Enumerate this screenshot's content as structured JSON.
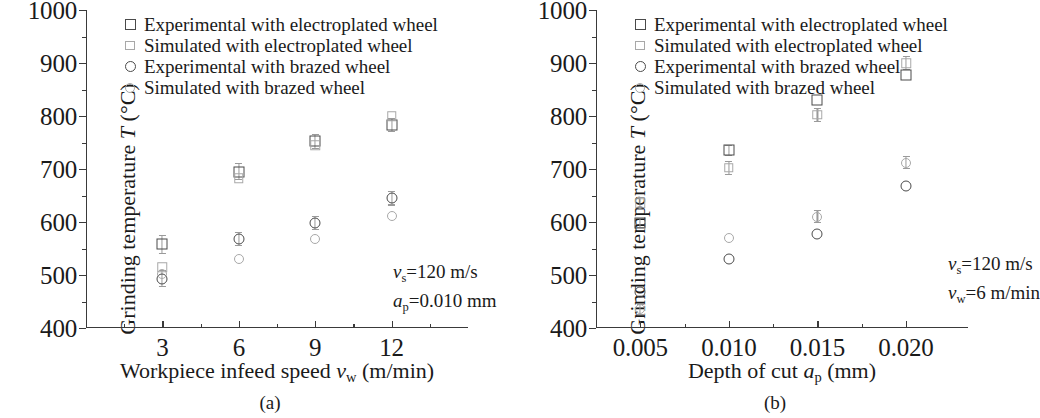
{
  "figure": {
    "panels": [
      {
        "caption": "(a)",
        "ytitle_prefix": "Grinding temperature ",
        "ytitle_var": "T",
        "ytitle_suffix": " (°C)",
        "xtitle_prefix": "Workpiece infeed speed ",
        "xtitle_var": "v",
        "xtitle_sub": "w",
        "xtitle_suffix": " (m/min)",
        "annotation": [
          {
            "var": "v",
            "sub": "s",
            "rest": "=120 m/s"
          },
          {
            "var": "a",
            "sub": "p",
            "rest": "=0.010 mm"
          }
        ]
      },
      {
        "caption": "(b)",
        "ytitle_prefix": "Grinding temperature ",
        "ytitle_var": "T",
        "ytitle_suffix": " (°C)",
        "xtitle_prefix": "Depth of cut ",
        "xtitle_var": "a",
        "xtitle_sub": "p",
        "xtitle_suffix": " (mm)",
        "annotation": [
          {
            "var": "v",
            "sub": "s",
            "rest": "=120 m/s"
          },
          {
            "var": "v",
            "sub": "w",
            "rest": "=6 m/min"
          }
        ]
      }
    ],
    "legend": [
      {
        "marker": "square-dark-icon",
        "label": "Experimental with electroplated wheel"
      },
      {
        "marker": "square-light-icon",
        "label": "Simulated with electroplated wheel"
      },
      {
        "marker": "circle-dark-icon",
        "label": "Experimental with brazed wheel"
      },
      {
        "marker": "circle-light-icon",
        "label": "Simulated with brazed wheel"
      }
    ]
  },
  "chart_data": [
    {
      "type": "scatter",
      "title": "(a) Grinding temperature vs workpiece infeed speed",
      "xlabel": "Workpiece infeed speed v_w (m/min)",
      "ylabel": "Grinding temperature T (°C)",
      "xlim": [
        0,
        15
      ],
      "ylim": [
        400,
        1000
      ],
      "yticks": [
        400,
        500,
        600,
        700,
        800,
        900,
        1000
      ],
      "yminorticks": [
        450,
        550,
        650,
        750,
        850,
        950
      ],
      "xticks": [
        3,
        6,
        9,
        12
      ],
      "xminorticks": [
        1.5,
        4.5,
        7.5,
        10.5,
        13.5
      ],
      "xtick_labels": [
        "3",
        "6",
        "9",
        "12"
      ],
      "ytick_labels": [
        "400",
        "500",
        "600",
        "700",
        "800",
        "900",
        "1000"
      ],
      "grid": false,
      "legend_position": "upper-left",
      "annotations": [
        "v_s=120 m/s",
        "a_p=0.010 mm"
      ],
      "x": [
        3,
        6,
        9,
        12
      ],
      "series": [
        {
          "name": "Experimental with electroplated wheel",
          "marker": "square-dark",
          "values": [
            558,
            695,
            752,
            783
          ],
          "errors": [
            18,
            16,
            14,
            14
          ]
        },
        {
          "name": "Simulated with electroplated wheel",
          "marker": "square-light",
          "values": [
            515,
            683,
            745,
            800
          ],
          "errors": [
            0,
            0,
            0,
            0
          ]
        },
        {
          "name": "Experimental with brazed wheel",
          "marker": "circle-dark",
          "values": [
            493,
            568,
            598,
            645
          ],
          "errors": [
            16,
            14,
            14,
            14
          ]
        },
        {
          "name": "Simulated with brazed wheel",
          "marker": "circle-light",
          "values": [
            502,
            530,
            568,
            612
          ],
          "errors": [
            0,
            0,
            0,
            0
          ]
        }
      ]
    },
    {
      "type": "scatter",
      "title": "(b) Grinding temperature vs depth of cut",
      "xlabel": "Depth of cut a_p (mm)",
      "ylabel": "Grinding temperature T (°C)",
      "xlim": [
        0.0025,
        0.0235
      ],
      "ylim": [
        400,
        1000
      ],
      "yticks": [
        400,
        500,
        600,
        700,
        800,
        900,
        1000
      ],
      "yminorticks": [
        450,
        550,
        650,
        750,
        850,
        950
      ],
      "xticks": [
        0.005,
        0.01,
        0.015,
        0.02
      ],
      "xminorticks": [
        0.0075,
        0.0125,
        0.0175
      ],
      "xtick_labels": [
        "0.005",
        "0.010",
        "0.015",
        "0.020"
      ],
      "ytick_labels": [
        "400",
        "500",
        "600",
        "700",
        "800",
        "900",
        "1000"
      ],
      "grid": false,
      "legend_position": "upper-left",
      "annotations": [
        "v_s=120 m/s",
        "v_w=6 m/min"
      ],
      "x": [
        0.005,
        0.01,
        0.015,
        0.02
      ],
      "series": [
        {
          "name": "Experimental with electroplated wheel",
          "marker": "square-dark",
          "values": [
            598,
            735,
            830,
            877
          ],
          "errors": [
            10,
            10,
            0,
            0
          ]
        },
        {
          "name": "Simulated with electroplated wheel",
          "marker": "square-light",
          "values": [
            635,
            702,
            802,
            900
          ],
          "errors": [
            12,
            14,
            14,
            14
          ]
        },
        {
          "name": "Experimental with brazed wheel",
          "marker": "circle-dark",
          "values": [
            468,
            530,
            578,
            668
          ],
          "errors": [
            0,
            0,
            0,
            0
          ]
        },
        {
          "name": "Simulated with brazed wheel",
          "marker": "circle-light",
          "values": [
            435,
            570,
            610,
            712
          ],
          "errors": [
            10,
            0,
            12,
            12
          ]
        }
      ]
    }
  ]
}
